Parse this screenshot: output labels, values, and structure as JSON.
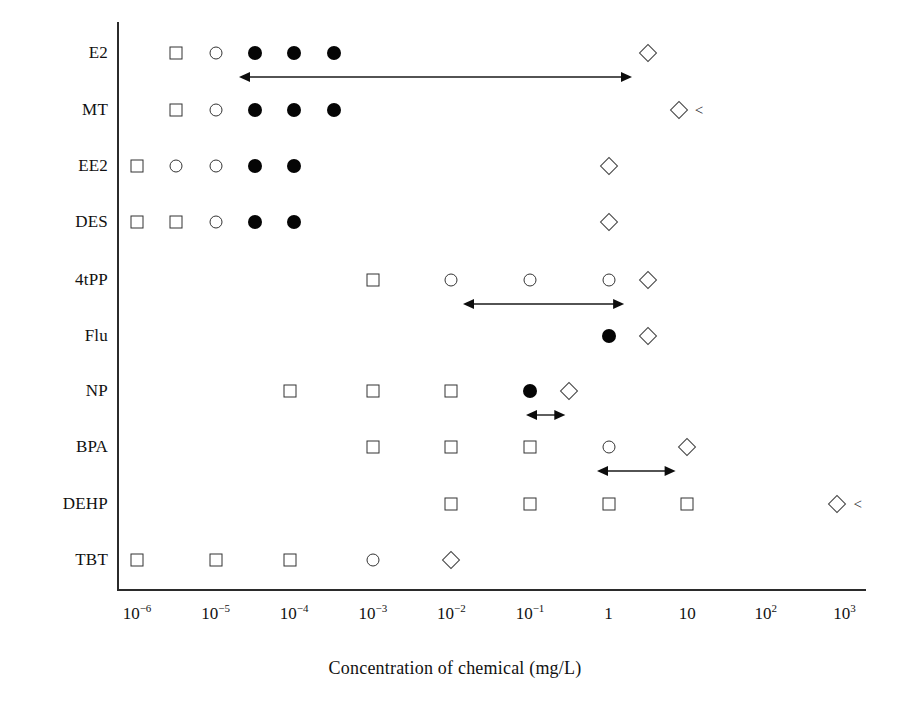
{
  "chart_data": {
    "type": "scatter",
    "title": "",
    "xlabel": "Concentration of chemical (mg/L)",
    "ylabel": "",
    "xscale": "log",
    "xlim": [
      -6.6,
      3.6
    ],
    "grid": false,
    "legend": "none",
    "x_tick_labels": [
      "10−6",
      "10−5",
      "10−4",
      "10−3",
      "10−2",
      "10−1",
      "1",
      "10",
      "10²",
      "10³"
    ],
    "x_tick_exponents": [
      -6,
      -5,
      -4,
      -3,
      -2,
      -1,
      0,
      1,
      2,
      3
    ],
    "x_tick_mantissa": [
      "10",
      "10",
      "10",
      "10",
      "10",
      "10",
      "1",
      "10",
      "10",
      "10"
    ],
    "x_tick_sup": [
      "-6",
      "-5",
      "-4",
      "-3",
      "-2",
      "-1",
      "",
      "",
      "2",
      "3"
    ],
    "categories": [
      "E2",
      "MT",
      "EE2",
      "DES",
      "4tPP",
      "Flu",
      "NP",
      "BPA",
      "DEHP",
      "TBT"
    ],
    "marker_types": [
      "open-square",
      "open-circle",
      "filled-circle",
      "open-diamond"
    ],
    "series": [
      {
        "name": "E2",
        "points": [
          {
            "x": -5.5,
            "marker": "open-square"
          },
          {
            "x": -5.0,
            "marker": "open-circle"
          },
          {
            "x": -4.5,
            "marker": "filled-circle"
          },
          {
            "x": -4.0,
            "marker": "filled-circle"
          },
          {
            "x": -3.5,
            "marker": "filled-circle"
          },
          {
            "x": 0.5,
            "marker": "open-diamond"
          }
        ],
        "arrow": {
          "from": -4.7,
          "to": 0.3,
          "heads": "both"
        },
        "less_than": false
      },
      {
        "name": "MT",
        "points": [
          {
            "x": -5.5,
            "marker": "open-square"
          },
          {
            "x": -5.0,
            "marker": "open-circle"
          },
          {
            "x": -4.5,
            "marker": "filled-circle"
          },
          {
            "x": -4.0,
            "marker": "filled-circle"
          },
          {
            "x": -3.5,
            "marker": "filled-circle"
          },
          {
            "x": 0.9,
            "marker": "open-diamond"
          }
        ],
        "arrow": null,
        "less_than": true,
        "less_than_x": 1.15
      },
      {
        "name": "EE2",
        "points": [
          {
            "x": -6.0,
            "marker": "open-square"
          },
          {
            "x": -5.5,
            "marker": "open-circle"
          },
          {
            "x": -5.0,
            "marker": "open-circle"
          },
          {
            "x": -4.5,
            "marker": "filled-circle"
          },
          {
            "x": -4.0,
            "marker": "filled-circle"
          },
          {
            "x": 0.0,
            "marker": "open-diamond"
          }
        ],
        "arrow": null,
        "less_than": false
      },
      {
        "name": "DES",
        "points": [
          {
            "x": -6.0,
            "marker": "open-square"
          },
          {
            "x": -5.5,
            "marker": "open-square"
          },
          {
            "x": -5.0,
            "marker": "open-circle"
          },
          {
            "x": -4.5,
            "marker": "filled-circle"
          },
          {
            "x": -4.0,
            "marker": "filled-circle"
          },
          {
            "x": 0.0,
            "marker": "open-diamond"
          }
        ],
        "arrow": null,
        "less_than": false
      },
      {
        "name": "4tPP",
        "points": [
          {
            "x": -3.0,
            "marker": "open-square"
          },
          {
            "x": -2.0,
            "marker": "open-circle"
          },
          {
            "x": -1.0,
            "marker": "open-circle"
          },
          {
            "x": 0.0,
            "marker": "open-circle"
          },
          {
            "x": 0.5,
            "marker": "open-diamond"
          }
        ],
        "arrow": {
          "from": -1.85,
          "to": 0.2,
          "heads": "both"
        },
        "less_than": false
      },
      {
        "name": "Flu",
        "points": [
          {
            "x": 0.0,
            "marker": "filled-circle"
          },
          {
            "x": 0.5,
            "marker": "open-diamond"
          }
        ],
        "arrow": null,
        "less_than": false
      },
      {
        "name": "NP",
        "points": [
          {
            "x": -4.05,
            "marker": "open-square"
          },
          {
            "x": -3.0,
            "marker": "open-square"
          },
          {
            "x": -2.0,
            "marker": "open-square"
          },
          {
            "x": -1.0,
            "marker": "filled-circle"
          },
          {
            "x": -0.5,
            "marker": "open-diamond"
          }
        ],
        "arrow": {
          "from": -1.05,
          "to": -0.55,
          "heads": "both"
        },
        "less_than": false
      },
      {
        "name": "BPA",
        "points": [
          {
            "x": -3.0,
            "marker": "open-square"
          },
          {
            "x": -2.0,
            "marker": "open-square"
          },
          {
            "x": -1.0,
            "marker": "open-square"
          },
          {
            "x": 0.0,
            "marker": "open-circle"
          },
          {
            "x": 1.0,
            "marker": "open-diamond"
          }
        ],
        "arrow": {
          "from": -0.15,
          "to": 0.85,
          "heads": "both"
        },
        "less_than": false
      },
      {
        "name": "DEHP",
        "points": [
          {
            "x": -2.0,
            "marker": "open-square"
          },
          {
            "x": -1.0,
            "marker": "open-square"
          },
          {
            "x": 0.0,
            "marker": "open-square"
          },
          {
            "x": 1.0,
            "marker": "open-square"
          },
          {
            "x": 2.9,
            "marker": "open-diamond"
          }
        ],
        "arrow": null,
        "less_than": true,
        "less_than_x": 3.17
      },
      {
        "name": "TBT",
        "points": [
          {
            "x": -6.0,
            "marker": "open-square"
          },
          {
            "x": -5.0,
            "marker": "open-square"
          },
          {
            "x": -4.05,
            "marker": "open-square"
          },
          {
            "x": -3.0,
            "marker": "open-circle"
          },
          {
            "x": -2.0,
            "marker": "open-diamond"
          }
        ],
        "arrow": null,
        "less_than": false
      }
    ],
    "annotations": [
      {
        "text": "<",
        "row": "MT"
      },
      {
        "text": "<",
        "row": "DEHP"
      }
    ]
  },
  "colors": {
    "axis": "#2b2b2b",
    "marker_outline": "#333333",
    "marker_fill_open": "#ffffff",
    "marker_fill_solid": "#050505",
    "text": "#111111",
    "background": "#ffffff"
  },
  "labels": {
    "less_than_symbol": "<"
  }
}
